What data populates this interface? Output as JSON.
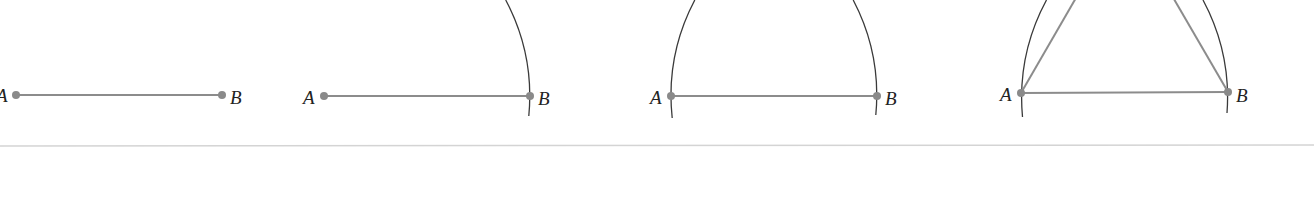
{
  "figure": {
    "colors": {
      "segment": "#8c8c8c",
      "arc": "#3a3a3a",
      "point": "#8a8a8a",
      "label": "#222222",
      "separator": "#d4d4d4"
    },
    "panels": [
      {
        "step": 1,
        "points": [
          {
            "label": "A",
            "x": 16,
            "y": 95
          },
          {
            "label": "B",
            "x": 222,
            "y": 95
          }
        ],
        "arcs": []
      },
      {
        "step": 2,
        "points": [
          {
            "label": "A",
            "x": 324,
            "y": 96
          },
          {
            "label": "B",
            "x": 530,
            "y": 96
          }
        ],
        "arcs": [
          {
            "center": "A",
            "radius": 206
          }
        ]
      },
      {
        "step": 3,
        "points": [
          {
            "label": "A",
            "x": 671,
            "y": 96
          },
          {
            "label": "B",
            "x": 877,
            "y": 96
          }
        ],
        "arcs": [
          {
            "center": "A",
            "radius": 206
          },
          {
            "center": "B",
            "radius": 206
          }
        ]
      },
      {
        "step": 4,
        "points": [
          {
            "label": "A",
            "x": 1021,
            "y": 93
          },
          {
            "label": "B",
            "x": 1228,
            "y": 92
          }
        ],
        "arcs": [
          {
            "center": "A",
            "radius": 207
          },
          {
            "center": "B",
            "radius": 207
          }
        ],
        "triangle_sides": [
          "AC",
          "BC"
        ]
      }
    ]
  },
  "labels": {
    "p1_a": "A",
    "p1_b": "B",
    "p2_a": "A",
    "p2_b": "B",
    "p3_a": "A",
    "p3_b": "B",
    "p4_a": "A",
    "p4_b": "B"
  }
}
